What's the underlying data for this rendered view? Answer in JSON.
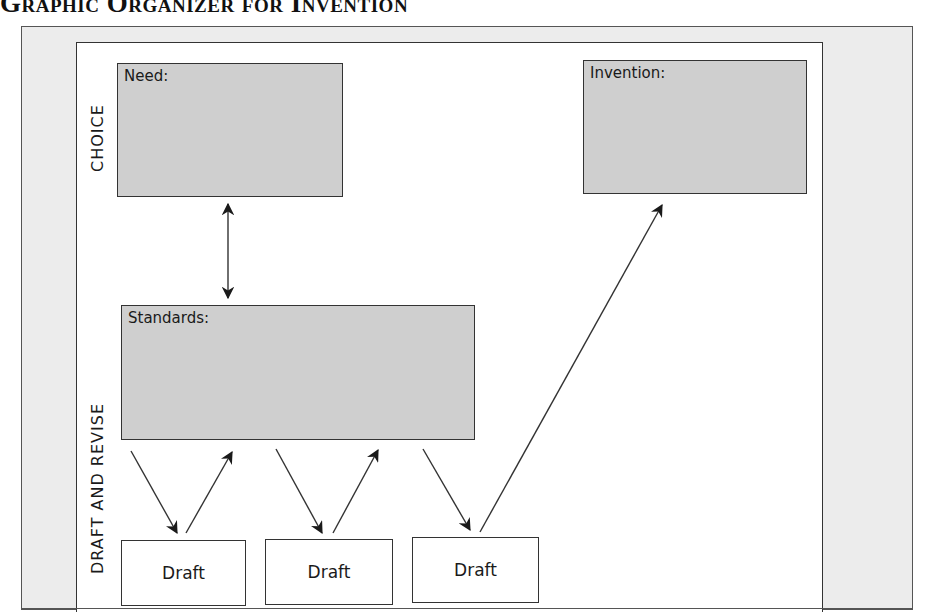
{
  "title": "Graphic Organizer for Invention",
  "sections": {
    "choice_label": "CHOICE",
    "draft_revise_label": "DRAFT AND REVISE"
  },
  "boxes": {
    "need": {
      "label": "Need:"
    },
    "invention": {
      "label": "Invention:"
    },
    "standards": {
      "label": "Standards:"
    }
  },
  "drafts": [
    {
      "label": "Draft"
    },
    {
      "label": "Draft"
    },
    {
      "label": "Draft"
    }
  ],
  "colors": {
    "gray_box_fill": "#cfcfcf",
    "frame_fill": "#ececec",
    "line": "#333333"
  },
  "arrows": [
    {
      "from": "need",
      "to": "standards",
      "type": "double"
    },
    {
      "from": "standards",
      "to": "draft-1",
      "type": "single"
    },
    {
      "from": "draft-1",
      "to": "standards",
      "type": "single"
    },
    {
      "from": "standards",
      "to": "draft-2",
      "type": "single"
    },
    {
      "from": "draft-2",
      "to": "standards",
      "type": "single"
    },
    {
      "from": "standards",
      "to": "draft-3",
      "type": "single"
    },
    {
      "from": "draft-3",
      "to": "invention",
      "type": "single"
    }
  ]
}
